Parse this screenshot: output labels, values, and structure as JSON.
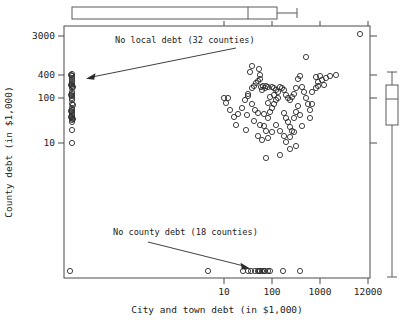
{
  "figure": {
    "width": 412,
    "height": 324,
    "background": "#ffffff",
    "line_color": "#4a4a4a",
    "point_color": "#2b2b2b"
  },
  "chart_data": {
    "type": "scatter",
    "title": "",
    "xlabel": "City and town debt (in $1,000)",
    "ylabel": "County debt (in $1,000)",
    "x_scale": "log",
    "y_scale": "log",
    "grid": false,
    "legend": null,
    "x_ticks": [
      {
        "label": "10",
        "value": 10,
        "px": 224
      },
      {
        "label": "100",
        "value": 100,
        "px": 272
      },
      {
        "label": "1000",
        "value": 1000,
        "px": 320
      },
      {
        "label": "12000",
        "value": 12000,
        "px": 368
      }
    ],
    "y_ticks": [
      {
        "label": "3000",
        "value": 3000,
        "px": 36
      },
      {
        "label": "400",
        "value": 400,
        "px": 75
      },
      {
        "label": "100",
        "value": 100,
        "px": 98
      },
      {
        "label": "10",
        "value": 10,
        "px": 143
      }
    ],
    "annotations": [
      {
        "text": "No local debt (32 counties)",
        "text_x": 115,
        "text_y": 43,
        "arrow_from_x": 236,
        "arrow_from_y": 48,
        "arrow_to_x": 88,
        "arrow_to_y": 79
      },
      {
        "text": "No county debt (18 counties)",
        "text_x": 113,
        "text_y": 235,
        "arrow_from_x": 148,
        "arrow_from_y": 242,
        "arrow_to_x": 248,
        "arrow_to_y": 269
      }
    ],
    "series": [
      {
        "name": "counties",
        "marker": "open-circle",
        "marker_radius": 2.6,
        "points_px": [
          [
            72,
            74
          ],
          [
            72,
            76
          ],
          [
            72,
            78
          ],
          [
            72,
            80
          ],
          [
            72,
            82
          ],
          [
            72,
            84
          ],
          [
            72,
            86
          ],
          [
            72,
            88
          ],
          [
            72,
            92
          ],
          [
            72,
            94
          ],
          [
            72,
            96
          ],
          [
            72,
            98
          ],
          [
            72,
            100
          ],
          [
            72,
            104
          ],
          [
            72,
            108
          ],
          [
            72,
            110
          ],
          [
            72,
            112
          ],
          [
            72,
            114
          ],
          [
            72,
            116
          ],
          [
            72,
            118
          ],
          [
            72,
            120
          ],
          [
            72,
            122
          ],
          [
            72,
            130
          ],
          [
            72,
            143
          ],
          [
            71,
            75
          ],
          [
            71,
            85
          ],
          [
            71,
            95
          ],
          [
            71,
            111
          ],
          [
            71,
            117
          ],
          [
            73,
            87
          ],
          [
            73,
            105
          ],
          [
            73,
            119
          ],
          [
            70,
            271
          ],
          [
            208,
            271
          ],
          [
            243,
            271
          ],
          [
            255,
            271
          ],
          [
            258,
            271
          ],
          [
            260,
            271
          ],
          [
            262,
            271
          ],
          [
            264,
            271
          ],
          [
            268,
            271
          ],
          [
            283,
            271
          ],
          [
            300,
            271
          ],
          [
            248,
            271
          ],
          [
            251,
            271
          ],
          [
            265,
            271
          ],
          [
            270,
            271
          ],
          [
            259,
            271
          ],
          [
            224,
            98
          ],
          [
            228,
            98
          ],
          [
            245,
            100
          ],
          [
            248,
            96
          ],
          [
            252,
            104
          ],
          [
            259,
            69
          ],
          [
            260,
            75
          ],
          [
            261,
            87
          ],
          [
            262,
            90
          ],
          [
            263,
            86
          ],
          [
            265,
            88
          ],
          [
            266,
            86
          ],
          [
            268,
            87
          ],
          [
            247,
            115
          ],
          [
            255,
            110
          ],
          [
            258,
            113
          ],
          [
            260,
            125
          ],
          [
            264,
            126
          ],
          [
            266,
            131
          ],
          [
            268,
            118
          ],
          [
            270,
            112
          ],
          [
            272,
            108
          ],
          [
            274,
            104
          ],
          [
            276,
            100
          ],
          [
            278,
            98
          ],
          [
            272,
            87
          ],
          [
            274,
            88
          ],
          [
            276,
            90
          ],
          [
            280,
            87
          ],
          [
            282,
            88
          ],
          [
            284,
            90
          ],
          [
            286,
            95
          ],
          [
            288,
            98
          ],
          [
            290,
            100
          ],
          [
            292,
            97
          ],
          [
            294,
            94
          ],
          [
            296,
            88
          ],
          [
            298,
            79
          ],
          [
            300,
            76
          ],
          [
            302,
            87
          ],
          [
            304,
            92
          ],
          [
            306,
            98
          ],
          [
            308,
            104
          ],
          [
            310,
            110
          ],
          [
            284,
            113
          ],
          [
            286,
            118
          ],
          [
            288,
            122
          ],
          [
            290,
            127
          ],
          [
            292,
            131
          ],
          [
            294,
            118
          ],
          [
            296,
            112
          ],
          [
            298,
            106
          ],
          [
            300,
            115
          ],
          [
            302,
            126
          ],
          [
            258,
            136
          ],
          [
            262,
            140
          ],
          [
            268,
            138
          ],
          [
            272,
            132
          ],
          [
            276,
            125
          ],
          [
            280,
            131
          ],
          [
            284,
            136
          ],
          [
            286,
            142
          ],
          [
            290,
            137
          ],
          [
            294,
            132
          ],
          [
            248,
            94
          ],
          [
            252,
            88
          ],
          [
            254,
            86
          ],
          [
            256,
            83
          ],
          [
            258,
            81
          ],
          [
            260,
            79
          ],
          [
            310,
            118
          ],
          [
            312,
            92
          ],
          [
            316,
            88
          ],
          [
            318,
            86
          ],
          [
            320,
            76
          ],
          [
            322,
            80
          ],
          [
            324,
            85
          ],
          [
            326,
            78
          ],
          [
            330,
            76
          ],
          [
            336,
            75
          ],
          [
            250,
            72
          ],
          [
            252,
            66
          ],
          [
            316,
            77
          ],
          [
            318,
            82
          ],
          [
            312,
            104
          ],
          [
            306,
            57
          ],
          [
            266,
            158
          ],
          [
            280,
            155
          ],
          [
            290,
            149
          ],
          [
            296,
            146
          ],
          [
            264,
            114
          ],
          [
            268,
            103
          ],
          [
            270,
            97
          ],
          [
            274,
            95
          ],
          [
            278,
            92
          ],
          [
            242,
            108
          ],
          [
            238,
            114
          ],
          [
            234,
            117
          ],
          [
            230,
            110
          ],
          [
            226,
            103
          ],
          [
            360,
            34
          ],
          [
            246,
            130
          ],
          [
            254,
            121
          ],
          [
            236,
            125
          ]
        ]
      }
    ],
    "top_boxplot": {
      "orientation": "horizontal",
      "box_left_px": 72,
      "box_right_px": 277,
      "median_px": 248,
      "whisker_low_px": 72,
      "whisker_high_px": 297,
      "y_center_px": 13,
      "box_half_height_px": 6
    },
    "right_boxplot": {
      "orientation": "vertical",
      "box_top_px": 85,
      "box_bottom_px": 125,
      "median_px": 99,
      "whisker_high_px": 72,
      "whisker_low_px": 277,
      "x_center_px": 392,
      "box_half_width_px": 6
    }
  },
  "plot_frame": {
    "left": 64,
    "top": 26,
    "right": 370,
    "bottom": 278
  }
}
